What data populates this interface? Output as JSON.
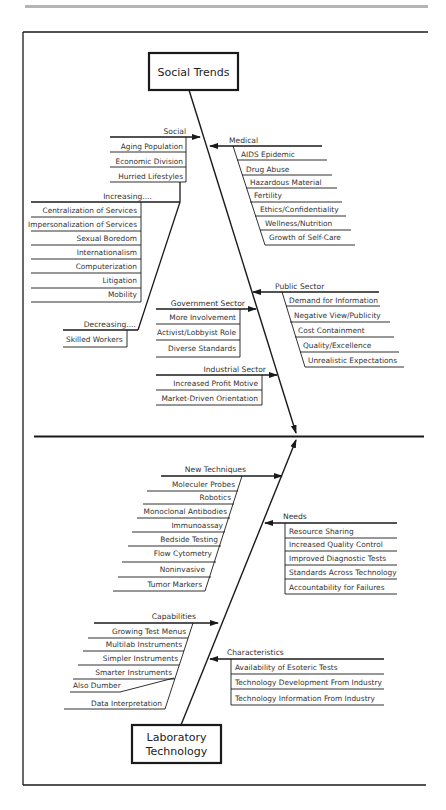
{
  "diagram": {
    "type": "fishbone",
    "top_effect_box": "Social Trends",
    "bottom_effect_box": [
      "Laboratory",
      "Technology"
    ],
    "colors": {
      "line": "#1a1a1a",
      "header_bar": "#b5b5b5",
      "text": "#333333"
    },
    "upper_branches": {
      "social": {
        "label": "Social",
        "items": [
          "Aging Population",
          "Economic Division",
          "Hurried Lifestyles"
        ]
      },
      "increasing": {
        "label": "Increasing....",
        "items": [
          "Centralization of Services",
          "Impersonalization of Services",
          "Sexual Boredom",
          "Internationalism",
          "Computerization",
          "Litigation",
          "Mobility"
        ]
      },
      "decreasing": {
        "label": "Decreasing....",
        "items": [
          "Skilled Workers"
        ]
      },
      "medical": {
        "label": "Medical",
        "items": [
          "AIDS Epidemic",
          "Drug Abuse",
          "Hazardous Material",
          "Fertility",
          "Ethics/Confidentiality",
          "Wellness/Nutrition",
          "Growth of Self-Care"
        ]
      },
      "public_sector": {
        "label": "Public Sector",
        "items": [
          "Demand for Information",
          "Negative View/Publicity",
          "Cost Containment",
          "Quality/Excellence",
          "Unrealistic Expectations"
        ]
      },
      "government_sector": {
        "label": "Government Sector",
        "items": [
          "More Involvement",
          "Activist/Lobbyist Role",
          "Diverse Standards"
        ]
      },
      "industrial_sector": {
        "label": "Industrial Sector",
        "items": [
          "Increased Profit Motive",
          "Market-Driven Orientation"
        ]
      }
    },
    "lower_branches": {
      "new_techniques": {
        "label": "New Techniques",
        "items": [
          "Moleculer Probes",
          "Robotics",
          "Monoclonal Antibodies",
          "Immunoassay",
          "Bedside Testing",
          "Flow Cytometry",
          "Noninvasive",
          "Tumor Markers"
        ]
      },
      "needs": {
        "label": "Needs",
        "items": [
          "Resource Sharing",
          "Increased Quality Control",
          "Improved Diagnostic Tests",
          "Standards Across Technology",
          "Accountability for Failures"
        ]
      },
      "capabilities": {
        "label": "Capabilities",
        "items": [
          "Growing Test Menus",
          "Multilab Instruments",
          "Simpler Instruments",
          "Smarter Instruments",
          "Also Dumber",
          "Data Interpretation"
        ]
      },
      "characteristics": {
        "label": "Characteristics",
        "items": [
          "Availability of Esoteric Tests",
          "Technology Development From Industry",
          "Technology Information From Industry"
        ]
      }
    }
  }
}
